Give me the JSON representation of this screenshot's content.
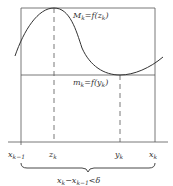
{
  "diagram": {
    "type": "riemann-oscillation-illustration",
    "max_label": "M_k = f(x_k)",
    "max_label_main": "M",
    "max_label_rest": "=f(",
    "max_label_arg": "z",
    "min_label_main": "m",
    "min_label_rest": "=f(",
    "min_label_arg": "y",
    "axis_labels": [
      {
        "main": "x",
        "sub": "k−1"
      },
      {
        "main": "z",
        "sub": "k"
      },
      {
        "main": "y",
        "sub": "k"
      },
      {
        "main": "x",
        "sub": "k"
      }
    ],
    "brace_label": "x_k − x_{k−1} < δ",
    "brace_part1": "x",
    "brace_sub1": "k",
    "brace_minus": "−x",
    "brace_sub2": "k−1",
    "brace_lt_delta": "<δ",
    "sub_k": "k",
    "close_paren": ")",
    "colors": {
      "line": "#444444",
      "curve": "#333333",
      "text": "#333333"
    }
  }
}
